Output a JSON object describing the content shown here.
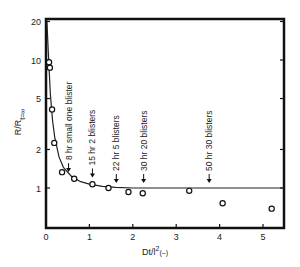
{
  "chart_data": {
    "type": "scatter",
    "title": "",
    "xlabel": "Dt/l² (–)",
    "ylabel": "R/R t=∞",
    "ylabel_main": "R/R",
    "ylabel_sub": "t=∞",
    "xlabel_main": "Dt/l",
    "xlabel_sup": "2",
    "xlabel_unit": "(–)",
    "xlim": [
      0,
      5.5
    ],
    "ylim": [
      0.5,
      20
    ],
    "yscale": "log",
    "grid": false,
    "x_ticks": [
      "0",
      "1",
      "2",
      "3",
      "4",
      "5"
    ],
    "y_ticks": [
      "1",
      "2",
      "5",
      "10",
      "20"
    ],
    "series": [
      {
        "name": "measured",
        "marker": "open-circle",
        "x": [
          0.07,
          0.09,
          0.14,
          0.19,
          0.37,
          0.65,
          1.07,
          1.44,
          1.9,
          2.23,
          3.3,
          4.07,
          5.2
        ],
        "y": [
          9.6,
          8.7,
          4.1,
          2.25,
          1.33,
          1.18,
          1.07,
          1.0,
          0.93,
          0.91,
          0.95,
          0.76,
          0.69
        ]
      },
      {
        "name": "fitted curve",
        "marker": "line",
        "x": [
          0.02,
          0.05,
          0.1,
          0.15,
          0.2,
          0.3,
          0.4,
          0.6,
          0.8,
          1.0,
          1.3,
          1.6,
          2.0,
          3.0,
          4.0,
          5.5
        ],
        "y": [
          20,
          12,
          5.5,
          3.4,
          2.5,
          1.75,
          1.45,
          1.22,
          1.12,
          1.07,
          1.03,
          1.01,
          1.0,
          1.0,
          1.0,
          1.0
        ]
      }
    ],
    "annotations": [
      {
        "x": 0.52,
        "text": "8 hr  small one blister"
      },
      {
        "x": 1.07,
        "text": "15 hr  2 blisters"
      },
      {
        "x": 1.62,
        "text": "22 hr  5 blisters"
      },
      {
        "x": 2.25,
        "text": "30 hr  20 blisters"
      },
      {
        "x": 3.76,
        "text": "50 hr  30 blisters"
      }
    ]
  }
}
